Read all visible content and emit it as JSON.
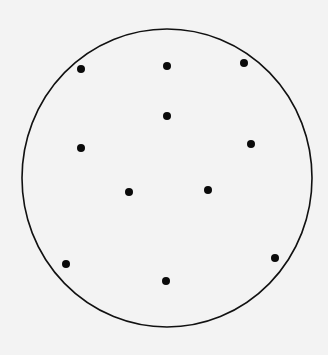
{
  "canvas": {
    "width": 328,
    "height": 355,
    "background": "#f3f3f3"
  },
  "boundary": {
    "shape": "circle",
    "cx": 167,
    "cy": 178,
    "rx": 145,
    "ry": 149,
    "stroke": "#111111",
    "stroke_width": 1.6,
    "fill": "none"
  },
  "points": {
    "radius": 4,
    "color": "#0a0a0a",
    "items": [
      {
        "x": 81,
        "y": 69
      },
      {
        "x": 167,
        "y": 66
      },
      {
        "x": 244,
        "y": 63
      },
      {
        "x": 167,
        "y": 116
      },
      {
        "x": 81,
        "y": 148
      },
      {
        "x": 251,
        "y": 144
      },
      {
        "x": 129,
        "y": 192
      },
      {
        "x": 208,
        "y": 190
      },
      {
        "x": 66,
        "y": 264
      },
      {
        "x": 275,
        "y": 258
      },
      {
        "x": 166,
        "y": 281
      }
    ]
  }
}
